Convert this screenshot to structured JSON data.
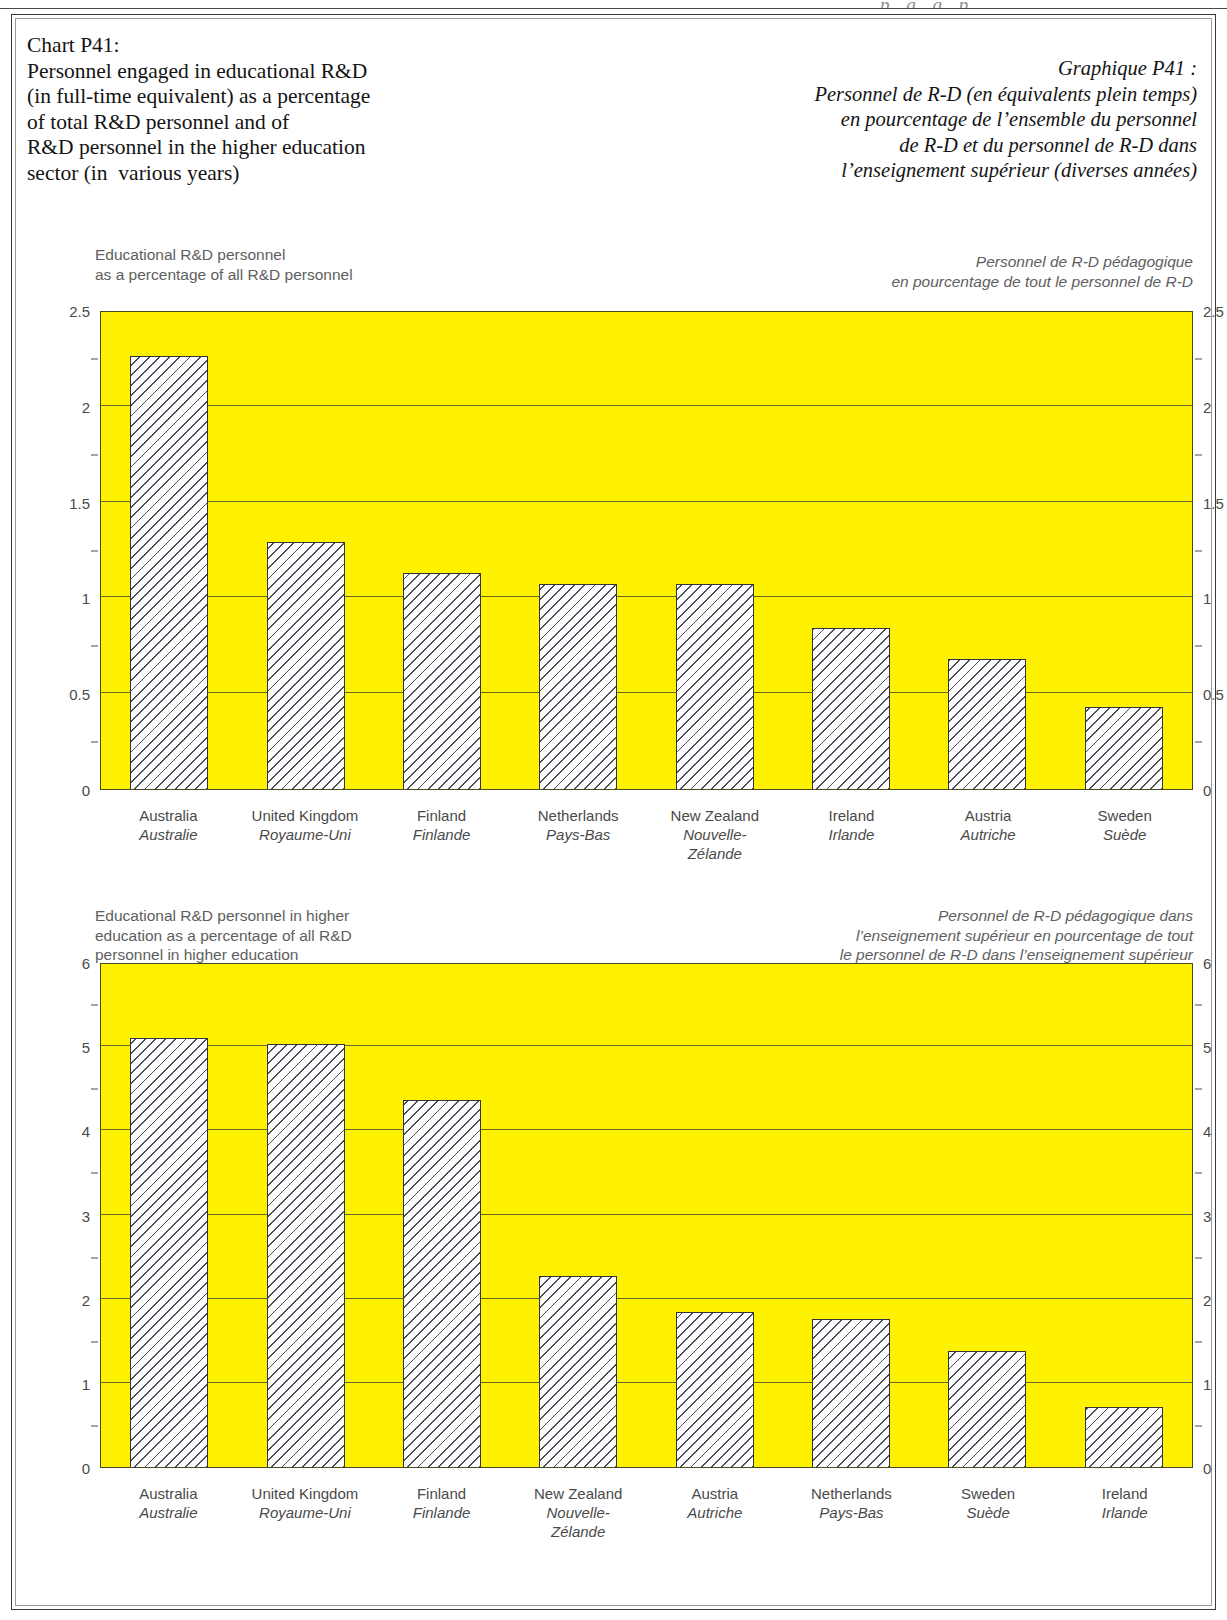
{
  "page": {
    "top_ghost_text": "p    g g p"
  },
  "title": {
    "en_lines": [
      "Chart P41:",
      "Personnel engaged in educational R&D",
      "(in full-time equivalent) as a percentage",
      "of total R&D personnel and of",
      "R&D personnel in the higher education",
      "sector (in  various years)"
    ],
    "fr_lines": [
      "Graphique P41 :",
      "Personnel de R-D (en équivalents plein temps)",
      "en pourcentage de l’ensemble du personnel",
      "de R-D et du personnel de R-D dans",
      "l’enseignement supérieur (diverses années)"
    ]
  },
  "colors": {
    "plot_background": "#fff200",
    "bar_fill": "#fdfdfd",
    "bar_hatch": "#4d4d5a",
    "bar_border": "#33333f",
    "gridline": "#6a6a28",
    "axis_text": "#4a4a4a",
    "subtitle_text": "#5e5e5e",
    "frame": "#3a3a3a"
  },
  "chart_data": [
    {
      "type": "bar",
      "id": "chart-top",
      "title_en_lines": [
        "Educational R&D personnel",
        "as a percentage of all R&D personnel"
      ],
      "title_fr_lines": [
        "Personnel de R-D pédagogique",
        "en pourcentage de tout le personnel de R-D"
      ],
      "xlabel": "",
      "ylabel": "",
      "ylim": [
        0,
        2.5
      ],
      "yticks": [
        0,
        0.5,
        1,
        1.5,
        2,
        2.5
      ],
      "ytick_labels": [
        "0",
        "0.5",
        "1",
        "1.5",
        "2",
        "2.5"
      ],
      "minor_ticks": [
        0.25,
        0.75,
        1.25,
        1.75,
        2.25
      ],
      "grid": true,
      "legend": "none",
      "categories": [
        "Australia",
        "United Kingdom",
        "Finland",
        "Netherlands",
        "New Zealand",
        "Ireland",
        "Austria",
        "Sweden"
      ],
      "categories_fr": [
        "Australie",
        "Royaume-Uni",
        "Finlande",
        "Pays-Bas",
        "Nouvelle-\nZélande",
        "Irlande",
        "Autriche",
        "Suède"
      ],
      "values": [
        2.26,
        1.29,
        1.13,
        1.07,
        1.07,
        0.84,
        0.68,
        0.43
      ]
    },
    {
      "type": "bar",
      "id": "chart-bottom",
      "title_en_lines": [
        "Educational R&D personnel in higher",
        "education as a percentage of all R&D",
        "personnel in higher education"
      ],
      "title_fr_lines": [
        "Personnel de R-D pédagogique dans",
        "l’enseignement supérieur en pourcentage de tout",
        "le personnel de R-D dans l’enseignement supérieur"
      ],
      "xlabel": "",
      "ylabel": "",
      "ylim": [
        0,
        6
      ],
      "yticks": [
        0,
        1,
        2,
        3,
        4,
        5,
        6
      ],
      "ytick_labels": [
        "0",
        "1",
        "2",
        "3",
        "4",
        "5",
        "6"
      ],
      "minor_ticks": [
        0.5,
        1.5,
        2.5,
        3.5,
        4.5,
        5.5
      ],
      "grid": true,
      "legend": "none",
      "categories": [
        "Australia",
        "United Kingdom",
        "Finland",
        "New Zealand",
        "Austria",
        "Netherlands",
        "Sweden",
        "Ireland"
      ],
      "categories_fr": [
        "Australie",
        "Royaume-Uni",
        "Finlande",
        "Nouvelle-\nZélande",
        "Autriche",
        "Pays-Bas",
        "Suède",
        "Irlande"
      ],
      "values": [
        5.1,
        5.03,
        4.36,
        2.27,
        1.84,
        1.76,
        1.38,
        0.71
      ]
    }
  ]
}
